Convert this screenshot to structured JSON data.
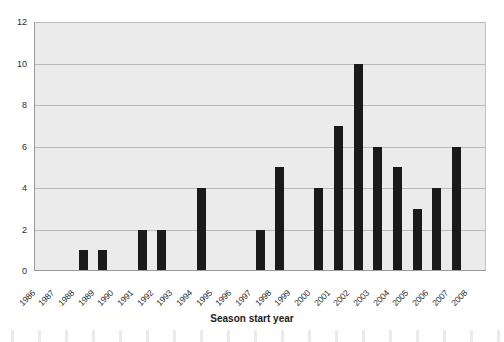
{
  "chart_data": {
    "type": "bar",
    "title": "",
    "xlabel": "Season start year",
    "ylabel": "",
    "categories": [
      "1986",
      "1987",
      "1988",
      "1989",
      "1990",
      "1991",
      "1992",
      "1993",
      "1994",
      "1995",
      "1996",
      "1997",
      "1998",
      "1999",
      "2000",
      "2001",
      "2002",
      "2003",
      "2004",
      "2005",
      "2006",
      "2007",
      "2008"
    ],
    "values": [
      0,
      0,
      1,
      1,
      0,
      2,
      2,
      0,
      4,
      0,
      0,
      2,
      5,
      0,
      4,
      7,
      10,
      6,
      5,
      3,
      4,
      6,
      0
    ],
    "ylim": [
      0,
      12
    ],
    "yticks": [
      0,
      2,
      4,
      6,
      8,
      10,
      12
    ],
    "ytick_labels": [
      "0",
      "2",
      "4",
      "6",
      "8",
      "10",
      "12"
    ],
    "grid": true,
    "legend": false,
    "bar_color": "#1a1a1a",
    "plot_background": "#ebebeb",
    "gridline_color": "#b9b9b9"
  }
}
